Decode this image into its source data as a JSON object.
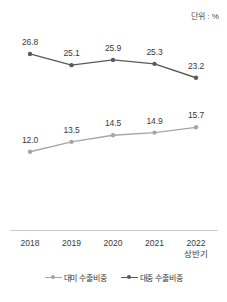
{
  "unit_note": "단위 : %",
  "legend": {
    "items": [
      {
        "label": "대미 수출비중",
        "color": "#a6a6a6",
        "icon": "line-marker-icon"
      },
      {
        "label": "대중 수출비중",
        "color": "#5a5a5a",
        "icon": "line-marker-icon"
      }
    ]
  },
  "axis": {
    "ticks": [
      {
        "main": "2018",
        "sub": ""
      },
      {
        "main": "2019",
        "sub": ""
      },
      {
        "main": "2020",
        "sub": ""
      },
      {
        "main": "2021",
        "sub": ""
      },
      {
        "main": "2022",
        "sub": "상반기"
      }
    ]
  },
  "labels": {
    "china": [
      "26.8",
      "25.1",
      "25.9",
      "25.3",
      "23.2"
    ],
    "us": [
      "12.0",
      "13.5",
      "14.5",
      "14.9",
      "15.7"
    ]
  },
  "chart_data": {
    "type": "line",
    "title": "",
    "subtitle": "",
    "xlabel": "",
    "ylabel": "",
    "annotations": [
      "단위 : %"
    ],
    "categories": [
      "2018",
      "2019",
      "2020",
      "2021",
      "2022 상반기"
    ],
    "series": [
      {
        "name": "대중 수출비중",
        "color": "#5a5a5a",
        "values": [
          26.8,
          25.1,
          25.9,
          25.3,
          23.2
        ]
      },
      {
        "name": "대미 수출비중",
        "color": "#a6a6a6",
        "values": [
          12.0,
          13.5,
          14.5,
          14.9,
          15.7
        ]
      }
    ],
    "ylim": [
      10,
      28
    ],
    "grid": false,
    "legend_position": "bottom"
  }
}
